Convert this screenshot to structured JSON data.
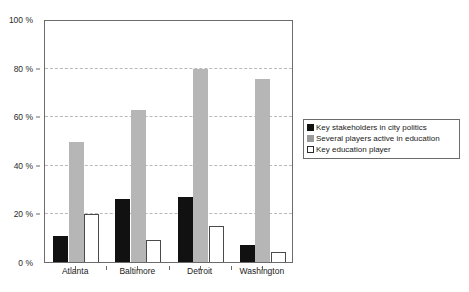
{
  "chart_data": {
    "type": "bar",
    "title": "",
    "subtitle": "",
    "xlabel": "",
    "ylabel": "",
    "categories": [
      "Atlanta",
      "Baltimore",
      "Detroit",
      "Washington"
    ],
    "series": [
      {
        "name": "Key stakeholders in city politics",
        "color": "#111111",
        "values": [
          11,
          26,
          27,
          7
        ]
      },
      {
        "name": "Several players active in education",
        "color": "#b6b6b6",
        "values": [
          50,
          63,
          80,
          76
        ]
      },
      {
        "name": "Key education player",
        "color": "#ffffff",
        "values": [
          20,
          9,
          15,
          4
        ]
      }
    ],
    "ylim": [
      0,
      100
    ],
    "y_ticks": [
      0,
      20,
      40,
      60,
      80,
      100
    ],
    "y_tick_labels": [
      "0 %",
      "20 %",
      "40 %",
      "60 %",
      "80 %",
      "100 %"
    ],
    "grid": "horizontal-dashed",
    "legend_position": "right"
  },
  "legend": {
    "items": [
      {
        "label": "Key stakeholders in city politics",
        "swatch": "legend-swatch-black"
      },
      {
        "label": "Several players active in education",
        "swatch": "legend-swatch-gray"
      },
      {
        "label": "Key education player",
        "swatch": "legend-swatch-white"
      }
    ]
  }
}
